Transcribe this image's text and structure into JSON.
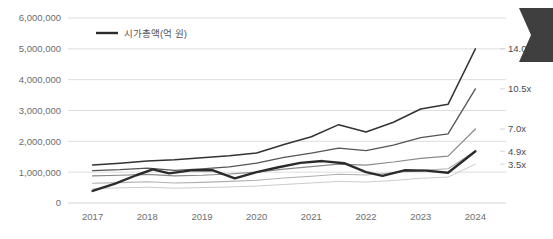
{
  "chart_data": {
    "type": "line",
    "title": "",
    "subtitle": "",
    "xlabel": "",
    "ylabel": "",
    "grid": true,
    "legend_position": "top-left",
    "x": [
      2017,
      2018,
      2019,
      2020,
      2021,
      2022,
      2023,
      2024
    ],
    "categories": [
      "2017",
      "2018",
      "2019",
      "2020",
      "2021",
      "2022",
      "2023",
      "2024"
    ],
    "xlim": [
      2016.55,
      2024.45
    ],
    "ylim": [
      0,
      6000000
    ],
    "yticks": [
      0,
      1000000,
      2000000,
      3000000,
      4000000,
      5000000,
      6000000
    ],
    "ytick_labels": [
      "0",
      "1,000,000",
      "2,000,000",
      "3,000,000",
      "4,000,000",
      "5,000,000",
      "6,000,000"
    ],
    "xtick_labels": [
      "2017",
      "2018",
      "2019",
      "2020",
      "2021",
      "2022",
      "2023",
      "2024"
    ],
    "legend": [
      {
        "label": "시가총액(억 원)",
        "color": "#2b2b2b",
        "width": 2.4
      }
    ],
    "right_labels": [
      {
        "text": "14.0x",
        "value": 5000000,
        "color": "#4a4a4a"
      },
      {
        "text": "10.5x",
        "value": 3700000,
        "color": "#4a4a4a"
      },
      {
        "text": "7.0x",
        "value": 2400000,
        "color": "#4a4a4a"
      },
      {
        "text": "4.9x",
        "value": 1680000,
        "color": "#4a4a4a"
      },
      {
        "text": "3.5x",
        "value": 1260000,
        "color": "#4a4a4a"
      }
    ],
    "series": [
      {
        "name": "14.0x",
        "color": "#333333",
        "width": 1.5,
        "end_label": "14.0x",
        "x": [
          2017,
          2017.5,
          2018,
          2018.5,
          2019,
          2019.5,
          2020,
          2020.5,
          2021,
          2021.5,
          2022,
          2022.5,
          2023,
          2023.5,
          2024
        ],
        "values": [
          1230000,
          1290000,
          1360000,
          1400000,
          1470000,
          1530000,
          1620000,
          1900000,
          2150000,
          2540000,
          2300000,
          2620000,
          3050000,
          3200000,
          5000000
        ]
      },
      {
        "name": "10.5x",
        "color": "#545454",
        "width": 1.3,
        "end_label": "10.5x",
        "x": [
          2017,
          2017.5,
          2018,
          2018.5,
          2019,
          2019.5,
          2020,
          2020.5,
          2021,
          2021.5,
          2022,
          2022.5,
          2023,
          2023.5,
          2024
        ],
        "values": [
          1050000,
          1080000,
          1130000,
          1060000,
          1110000,
          1170000,
          1290000,
          1480000,
          1620000,
          1780000,
          1700000,
          1880000,
          2120000,
          2240000,
          3700000
        ]
      },
      {
        "name": "7.0x",
        "color": "#8a8a8a",
        "width": 1.2,
        "end_label": "7.0x",
        "x": [
          2017,
          2017.5,
          2018,
          2018.5,
          2019,
          2019.5,
          2020,
          2020.5,
          2021,
          2021.5,
          2022,
          2022.5,
          2023,
          2023.5,
          2024
        ],
        "values": [
          880000,
          900000,
          930000,
          880000,
          900000,
          940000,
          1000000,
          1100000,
          1180000,
          1260000,
          1230000,
          1330000,
          1450000,
          1520000,
          2400000
        ]
      },
      {
        "name": "4.9x-band",
        "color": "#b0b0b0",
        "width": 1.1,
        "end_label": "4.9x",
        "x": [
          2017,
          2017.5,
          2018,
          2018.5,
          2019,
          2019.5,
          2020,
          2020.5,
          2021,
          2021.5,
          2022,
          2022.5,
          2023,
          2023.5,
          2024
        ],
        "values": [
          640000,
          660000,
          690000,
          650000,
          670000,
          700000,
          740000,
          810000,
          870000,
          930000,
          910000,
          980000,
          1060000,
          1110000,
          1680000
        ]
      },
      {
        "name": "3.5x-band",
        "color": "#cccccc",
        "width": 1.0,
        "end_label": "3.5x",
        "x": [
          2017,
          2017.5,
          2018,
          2018.5,
          2019,
          2019.5,
          2020,
          2020.5,
          2021,
          2021.5,
          2022,
          2022.5,
          2023,
          2023.5,
          2024
        ],
        "values": [
          470000,
          490000,
          510000,
          480000,
          500000,
          520000,
          550000,
          600000,
          650000,
          700000,
          680000,
          730000,
          800000,
          840000,
          1260000
        ]
      },
      {
        "name": "시가총액(억 원)",
        "color": "#2b2b2b",
        "width": 2.4,
        "end_label": "",
        "x": [
          2017,
          2017.4,
          2017.8,
          2018.1,
          2018.4,
          2018.8,
          2019.2,
          2019.6,
          2020.0,
          2020.4,
          2020.8,
          2021.2,
          2021.6,
          2022.0,
          2022.3,
          2022.7,
          2023.1,
          2023.5,
          2024
        ],
        "values": [
          390000,
          620000,
          900000,
          1090000,
          960000,
          1060000,
          1060000,
          800000,
          1000000,
          1160000,
          1300000,
          1360000,
          1290000,
          1000000,
          880000,
          1060000,
          1050000,
          980000,
          1680000
        ]
      }
    ]
  },
  "decorations": {
    "corner_marker": {
      "name": "chevron-left-marker",
      "color": "#3f3f3f"
    }
  }
}
